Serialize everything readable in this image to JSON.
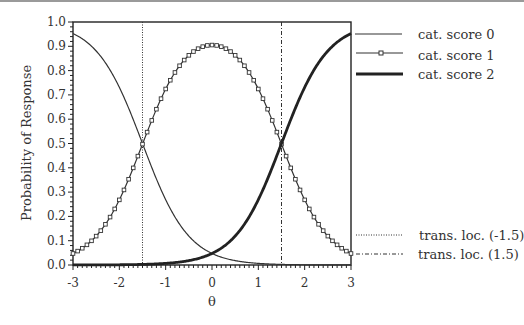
{
  "chart_data": {
    "type": "line",
    "title": "",
    "xlabel": "θ",
    "ylabel": "Probability of Response",
    "xlim": [
      -3,
      3
    ],
    "ylim": [
      0,
      1
    ],
    "xticks": [
      "-3",
      "-2",
      "-1",
      "0",
      "1",
      "2",
      "3"
    ],
    "yticks": [
      "0.0",
      "0.1",
      "0.2",
      "0.3",
      "0.4",
      "0.5",
      "0.6",
      "0.7",
      "0.8",
      "0.9",
      "1.0"
    ],
    "grid": false,
    "legend_position": "right",
    "model": {
      "discrimination": 2.0,
      "thresholds": [
        -1.5,
        1.5
      ]
    },
    "x": [
      -3.0,
      -2.5,
      -2.0,
      -1.5,
      -1.0,
      -0.5,
      0.0,
      0.5,
      1.0,
      1.5,
      2.0,
      2.5,
      3.0
    ],
    "series": [
      {
        "name": "cat. score 0",
        "style": "thin-solid",
        "values": [
          0.95,
          0.88,
          0.73,
          0.5,
          0.27,
          0.12,
          0.05,
          0.02,
          0.01,
          0.0,
          0.0,
          0.0,
          0.0
        ]
      },
      {
        "name": "cat. score 1",
        "style": "solid-square-markers",
        "values": [
          0.05,
          0.12,
          0.27,
          0.5,
          0.73,
          0.86,
          0.91,
          0.86,
          0.73,
          0.5,
          0.27,
          0.12,
          0.05
        ]
      },
      {
        "name": "cat. score 2",
        "style": "thick-solid",
        "values": [
          0.0,
          0.0,
          0.0,
          0.0,
          0.01,
          0.02,
          0.05,
          0.12,
          0.27,
          0.5,
          0.73,
          0.88,
          0.95
        ]
      }
    ],
    "vertical_lines": [
      {
        "name": "trans. loc. (-1.5)",
        "x": -1.5,
        "style": "dotted"
      },
      {
        "name": "trans. loc. (1.5)",
        "x": 1.5,
        "style": "dash-dot"
      }
    ]
  },
  "legend": {
    "items": [
      {
        "label": "cat. score 0"
      },
      {
        "label": "cat. score 1"
      },
      {
        "label": "cat. score 2"
      },
      {
        "label": "trans. loc. (-1.5)"
      },
      {
        "label": "trans. loc. (1.5)"
      }
    ]
  }
}
